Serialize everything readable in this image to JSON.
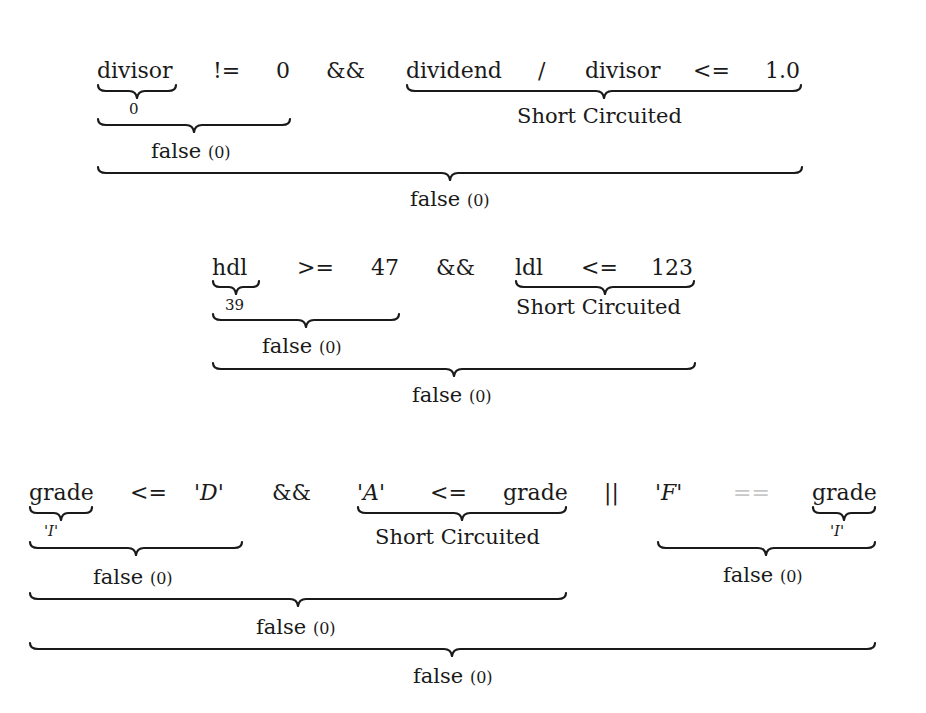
{
  "expressions": [
    {
      "tokens": [
        "divisor",
        "!=",
        "0",
        "&&",
        "dividend",
        "/",
        "divisor",
        "<=",
        "1.0"
      ],
      "annotations": {
        "divisor_value": "0",
        "short_circuit": "Short Circuited",
        "left_result": "false",
        "left_result_num": "(0)",
        "total_result": "false",
        "total_result_num": "(0)"
      }
    },
    {
      "tokens": [
        "hdl",
        ">=",
        "47",
        "&&",
        "ldl",
        "<=",
        "123"
      ],
      "annotations": {
        "hdl_value": "39",
        "short_circuit": "Short Circuited",
        "left_result": "false",
        "left_result_num": "(0)",
        "total_result": "false",
        "total_result_num": "(0)"
      }
    },
    {
      "tokens": [
        "grade",
        "<=",
        "'D'",
        "&&",
        "'A'",
        "<=",
        "grade",
        "||",
        "'F'",
        "==",
        "grade"
      ],
      "annotations": {
        "grade_value_left": "'I'",
        "grade_value_right": "'I'",
        "short_circuit": "Short Circuited",
        "left_result": "false",
        "left_result_num": "(0)",
        "and_result": "false",
        "and_result_num": "(0)",
        "or_right_result": "false",
        "or_right_result_num": "(0)",
        "total_result": "false",
        "total_result_num": "(0)"
      }
    }
  ]
}
